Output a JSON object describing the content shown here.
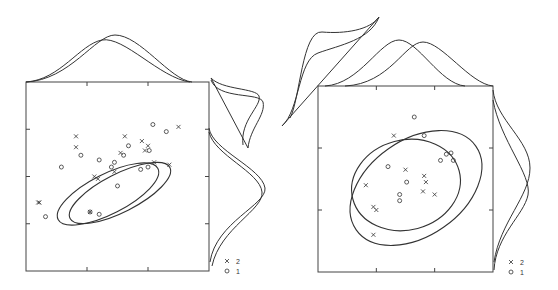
{
  "chart_data": [
    {
      "type": "scatter",
      "title": "",
      "xlabel": "",
      "ylabel": "",
      "xlim": [
        0,
        3
      ],
      "ylim": [
        0,
        4
      ],
      "grid": false,
      "xticks": [
        1,
        2
      ],
      "yticks": [
        1,
        2,
        3
      ],
      "legend": {
        "placement": "bottom-right",
        "entries": [
          {
            "marker": "x",
            "label": "2"
          },
          {
            "marker": "o",
            "label": "1"
          }
        ]
      },
      "series": [
        {
          "name": "2",
          "marker": "x",
          "points": [
            [
              0.22,
              1.45
            ],
            [
              0.82,
              2.62
            ],
            [
              0.82,
              2.85
            ],
            [
              1.12,
              2.0
            ],
            [
              1.18,
              1.95
            ],
            [
              1.45,
              2.1
            ],
            [
              1.55,
              2.5
            ],
            [
              1.62,
              2.85
            ],
            [
              1.9,
              2.75
            ],
            [
              1.95,
              2.55
            ],
            [
              2.0,
              2.65
            ],
            [
              2.1,
              2.3
            ],
            [
              2.35,
              2.25
            ],
            [
              2.5,
              3.05
            ],
            [
              1.05,
              1.25
            ],
            [
              0.2,
              1.45
            ]
          ]
        },
        {
          "name": "1",
          "marker": "o",
          "points": [
            [
              0.32,
              1.15
            ],
            [
              0.58,
              2.2
            ],
            [
              0.9,
              2.45
            ],
            [
              1.05,
              1.25
            ],
            [
              1.2,
              1.2
            ],
            [
              1.2,
              2.35
            ],
            [
              1.4,
              2.2
            ],
            [
              1.45,
              2.3
            ],
            [
              1.6,
              2.45
            ],
            [
              1.68,
              2.65
            ],
            [
              1.88,
              2.15
            ],
            [
              2.02,
              2.55
            ],
            [
              2.08,
              3.1
            ],
            [
              2.3,
              2.95
            ],
            [
              1.5,
              1.8
            ],
            [
              2.0,
              2.2
            ]
          ]
        }
      ],
      "ellipses": [
        {
          "group": "2",
          "center": [
            1.3,
            2.3
          ],
          "orientation": "positive"
        },
        {
          "group": "1",
          "center": [
            1.55,
            2.1
          ],
          "orientation": "positive"
        }
      ],
      "marginals": {
        "top": {
          "group_1_peak_x": 1.4,
          "group_2_peak_x": 1.2
        },
        "right": {
          "group_1_peak_y": 2.1,
          "group_2_peak_y": 2.3
        },
        "diagonal": "present"
      }
    },
    {
      "type": "scatter",
      "title": "",
      "xlabel": "",
      "ylabel": "",
      "xlim": [
        0,
        3
      ],
      "ylim": [
        0,
        3
      ],
      "grid": false,
      "xticks": [
        1,
        2
      ],
      "yticks": [
        1,
        2
      ],
      "legend": {
        "placement": "bottom-right",
        "entries": [
          {
            "marker": "x",
            "label": "2"
          },
          {
            "marker": "o",
            "label": "1"
          }
        ]
      },
      "series": [
        {
          "name": "2",
          "marker": "x",
          "points": [
            [
              1.3,
              2.2
            ],
            [
              0.82,
              1.4
            ],
            [
              0.95,
              1.05
            ],
            [
              1.0,
              1.0
            ],
            [
              0.95,
              0.6
            ],
            [
              1.5,
              1.65
            ],
            [
              1.82,
              1.55
            ],
            [
              1.85,
              1.45
            ],
            [
              1.8,
              1.3
            ],
            [
              2.0,
              1.25
            ]
          ]
        },
        {
          "name": "1",
          "marker": "o",
          "points": [
            [
              1.65,
              2.5
            ],
            [
              1.82,
              2.2
            ],
            [
              1.2,
              1.7
            ],
            [
              1.52,
              1.45
            ],
            [
              1.4,
              1.25
            ],
            [
              1.4,
              1.15
            ],
            [
              2.1,
              1.8
            ],
            [
              2.2,
              1.9
            ],
            [
              2.28,
              1.92
            ],
            [
              2.32,
              1.8
            ]
          ]
        }
      ],
      "ellipses": [
        {
          "group": "1",
          "center": [
            1.55,
            1.6
          ],
          "orientation": "near-circular"
        },
        {
          "group": "2",
          "center": [
            1.55,
            1.55
          ],
          "orientation": "positive"
        }
      ],
      "marginals": {
        "top": {
          "group_1_peak_x": 1.35,
          "group_2_peak_x": 1.75
        },
        "right": {
          "group_1_peak_y": 1.3,
          "group_2_peak_y": 1.7
        },
        "diagonal": "present"
      }
    }
  ]
}
